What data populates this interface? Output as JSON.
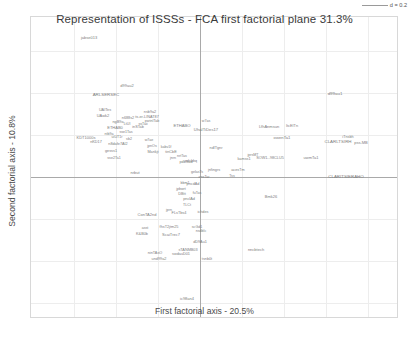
{
  "chart_data": {
    "type": "scatter",
    "title": "Representation of ISSSs - FCA first factorial plane 31.3%",
    "xlabel": "First factorial axis - 20.5%",
    "ylabel": "Second factorial axis - 10.8%",
    "grid": true,
    "legend": null,
    "scale_bar": "d = 0.2",
    "axis_origin": {
      "x": 199,
      "y": 176
    },
    "grid_spacing_px": 42,
    "note": "ade4-style FCA biplot; each point is a text label only (no marker glyph). Coordinates below are label centers in pixels of the 409x341 image.",
    "points": [
      {
        "label": "jabse013",
        "x": 88,
        "y": 37,
        "size": 4.0
      },
      {
        "label": "d99au2",
        "x": 126,
        "y": 85,
        "size": 4.0
      },
      {
        "label": "ARLSERSEC",
        "x": 105,
        "y": 94,
        "size": 4.4
      },
      {
        "label": "d99au1",
        "x": 334,
        "y": 93,
        "size": 4.4
      },
      {
        "label": "UAITes",
        "x": 104,
        "y": 110,
        "size": 3.8
      },
      {
        "label": "UAwk2",
        "x": 102,
        "y": 115,
        "size": 4.0
      },
      {
        "label": "nsb9a2",
        "x": 149,
        "y": 112,
        "size": 3.8
      },
      {
        "label": "ts-er-LINAT87",
        "x": 146,
        "y": 117,
        "size": 3.8
      },
      {
        "label": "pwtnITab",
        "x": 151,
        "y": 121,
        "size": 3.6
      },
      {
        "label": "n688s2",
        "x": 127,
        "y": 118,
        "size": 3.8
      },
      {
        "label": "ngB9a",
        "x": 117,
        "y": 122,
        "size": 3.8
      },
      {
        "label": "LtUl",
        "x": 126,
        "y": 124,
        "size": 3.6
      },
      {
        "label": "ETHAB0",
        "x": 114,
        "y": 127,
        "size": 4.0
      },
      {
        "label": "ETHABO",
        "x": 181,
        "y": 125,
        "size": 4.2
      },
      {
        "label": "inSTab",
        "x": 137,
        "y": 127,
        "size": 3.8
      },
      {
        "label": "ssTaii",
        "x": 142,
        "y": 124,
        "size": 3.6
      },
      {
        "label": "w7as",
        "x": 205,
        "y": 121,
        "size": 3.6
      },
      {
        "label": "UhaITiDes17",
        "x": 205,
        "y": 129,
        "size": 4.2
      },
      {
        "label": "LfhAnmsun",
        "x": 268,
        "y": 126,
        "size": 4.0
      },
      {
        "label": "ItcEITn",
        "x": 291,
        "y": 126,
        "size": 3.8
      },
      {
        "label": "sse1Tas",
        "x": 125,
        "y": 132,
        "size": 3.6
      },
      {
        "label": "KDT1000s",
        "x": 85,
        "y": 137,
        "size": 4.0
      },
      {
        "label": "ntb9a",
        "x": 108,
        "y": 134,
        "size": 3.6
      },
      {
        "label": "uiUT1r",
        "x": 116,
        "y": 137,
        "size": 3.6
      },
      {
        "label": "sb2",
        "x": 128,
        "y": 139,
        "size": 3.6
      },
      {
        "label": "nKD17",
        "x": 95,
        "y": 142,
        "size": 3.8
      },
      {
        "label": "n8dafe7AI2",
        "x": 117,
        "y": 144,
        "size": 3.8
      },
      {
        "label": "w7ae",
        "x": 148,
        "y": 140,
        "size": 3.6
      },
      {
        "label": "jpnOs",
        "x": 151,
        "y": 146,
        "size": 3.6
      },
      {
        "label": "Mankjt",
        "x": 152,
        "y": 152,
        "size": 3.8
      },
      {
        "label": "tinCbE",
        "x": 170,
        "y": 152,
        "size": 3.8
      },
      {
        "label": "kabv1f",
        "x": 165,
        "y": 147,
        "size": 3.6
      },
      {
        "label": "gesss1",
        "x": 110,
        "y": 151,
        "size": 3.8
      },
      {
        "label": "ndlTgnr",
        "x": 215,
        "y": 148,
        "size": 3.8
      },
      {
        "label": "owenTa1",
        "x": 281,
        "y": 137,
        "size": 4.2
      },
      {
        "label": "CLARLTSIRH",
        "x": 337,
        "y": 141,
        "size": 4.4
      },
      {
        "label": "iTnsbh",
        "x": 347,
        "y": 137,
        "size": 3.8
      },
      {
        "label": "pss-MB",
        "x": 360,
        "y": 142,
        "size": 4.0
      },
      {
        "label": "jprsMT",
        "x": 252,
        "y": 155,
        "size": 3.6
      },
      {
        "label": "SOW1--98CLU5",
        "x": 269,
        "y": 158,
        "size": 3.8
      },
      {
        "label": "kamss1",
        "x": 243,
        "y": 159,
        "size": 3.8
      },
      {
        "label": "uwmTa1",
        "x": 310,
        "y": 157,
        "size": 4.0
      },
      {
        "label": "sse2Ta1",
        "x": 113,
        "y": 158,
        "size": 3.6
      },
      {
        "label": "jnrn",
        "x": 172,
        "y": 158,
        "size": 3.6
      },
      {
        "label": "nrtTas",
        "x": 181,
        "y": 156,
        "size": 3.6
      },
      {
        "label": "pdbSad",
        "x": 185,
        "y": 162,
        "size": 3.8
      },
      {
        "label": "ndsbbq",
        "x": 190,
        "y": 161,
        "size": 3.6
      },
      {
        "label": "jnfingrs",
        "x": 213,
        "y": 170,
        "size": 3.8
      },
      {
        "label": "acesTm",
        "x": 237,
        "y": 170,
        "size": 3.8
      },
      {
        "label": "CLARITSIERAHO",
        "x": 345,
        "y": 176,
        "size": 4.4
      },
      {
        "label": "Tss",
        "x": 231,
        "y": 176,
        "size": 3.6
      },
      {
        "label": "nrbut",
        "x": 134,
        "y": 172,
        "size": 4.0
      },
      {
        "label": "gelasTs",
        "x": 196,
        "y": 172,
        "size": 3.6
      },
      {
        "label": "ansTar",
        "x": 203,
        "y": 177,
        "size": 3.6
      },
      {
        "label": "pncdAd",
        "x": 192,
        "y": 184,
        "size": 3.8
      },
      {
        "label": "bbm1",
        "x": 184,
        "y": 183,
        "size": 3.6
      },
      {
        "label": "jpbwrt",
        "x": 180,
        "y": 189,
        "size": 3.6
      },
      {
        "label": "DBtt",
        "x": 181,
        "y": 194,
        "size": 3.8
      },
      {
        "label": "fuTas",
        "x": 196,
        "y": 193,
        "size": 3.6
      },
      {
        "label": "Bmk26",
        "x": 270,
        "y": 196,
        "size": 4.0
      },
      {
        "label": "pnclAd",
        "x": 188,
        "y": 199,
        "size": 3.8
      },
      {
        "label": "TLCt",
        "x": 186,
        "y": 205,
        "size": 3.6
      },
      {
        "label": "jprn",
        "x": 168,
        "y": 210,
        "size": 3.6
      },
      {
        "label": "ConTA2nd",
        "x": 146,
        "y": 214,
        "size": 4.0
      },
      {
        "label": "FLsTbs4",
        "x": 178,
        "y": 213,
        "size": 3.8
      },
      {
        "label": "ichdes",
        "x": 202,
        "y": 212,
        "size": 3.8
      },
      {
        "label": "asst",
        "x": 144,
        "y": 228,
        "size": 3.6
      },
      {
        "label": "fhsT2jtm25",
        "x": 168,
        "y": 227,
        "size": 3.8
      },
      {
        "label": "scGd1",
        "x": 196,
        "y": 227,
        "size": 3.6
      },
      {
        "label": "K&B0b",
        "x": 141,
        "y": 234,
        "size": 3.8
      },
      {
        "label": "ScaiTrec7",
        "x": 170,
        "y": 234,
        "size": 4.0
      },
      {
        "label": "nsdblc",
        "x": 200,
        "y": 231,
        "size": 3.6
      },
      {
        "label": "dD9Au1",
        "x": 199,
        "y": 242,
        "size": 3.8
      },
      {
        "label": "nncbtech",
        "x": 255,
        "y": 249,
        "size": 4.0
      },
      {
        "label": "sTANMB03",
        "x": 187,
        "y": 250,
        "size": 3.8
      },
      {
        "label": "ninTAsO",
        "x": 154,
        "y": 253,
        "size": 3.8
      },
      {
        "label": "swdauD01",
        "x": 180,
        "y": 254,
        "size": 3.8
      },
      {
        "label": "und99a2",
        "x": 158,
        "y": 259,
        "size": 3.8
      },
      {
        "label": "tsnb0t",
        "x": 206,
        "y": 259,
        "size": 3.8
      },
      {
        "label": "ic98an4",
        "x": 186,
        "y": 298,
        "size": 4.0
      }
    ]
  }
}
